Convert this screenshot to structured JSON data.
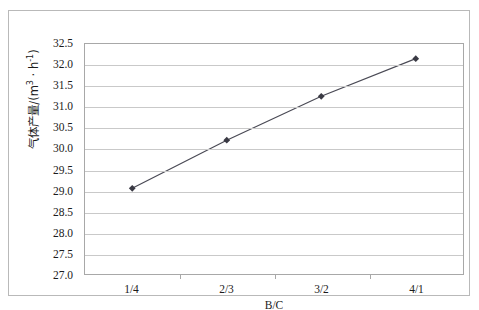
{
  "chart_data": {
    "type": "line",
    "title": "",
    "xlabel": "B/C",
    "ylabel_text": "气体产量/(m³ · h⁻¹)",
    "ylabel_main": "气体产量/(m",
    "ylabel_sup1": "3",
    "ylabel_mid": " · h",
    "ylabel_sup2": "-1",
    "ylabel_tail": ")",
    "categories": [
      "1/4",
      "2/3",
      "3/2",
      "4/1"
    ],
    "values": [
      29.05,
      30.2,
      31.25,
      32.15
    ],
    "series": [
      {
        "name": "气体产量",
        "values": [
          29.05,
          30.2,
          31.25,
          32.15
        ]
      }
    ],
    "ylim": [
      27.0,
      32.5
    ],
    "ytick_values": [
      27.0,
      27.5,
      28.0,
      28.5,
      29.0,
      29.5,
      30.0,
      30.5,
      31.0,
      31.5,
      32.0,
      32.5
    ],
    "ytick_labels": [
      "27.0",
      "27.5",
      "28.0",
      "28.5",
      "29.0",
      "29.5",
      "30.0",
      "30.5",
      "31.0",
      "31.5",
      "32.0",
      "32.5"
    ],
    "grid": true,
    "grid_axis": "y",
    "legend": false,
    "legend_position": "none",
    "marker": "diamond",
    "line_color": "#4a4a55",
    "marker_color": "#3a3a44",
    "grid_color": "#c9c9c9",
    "axis_color": "#a8a8a8",
    "plot_background": "#ffffff",
    "figure_background": "#ffffff",
    "frame_color": "#b9b9b9"
  }
}
